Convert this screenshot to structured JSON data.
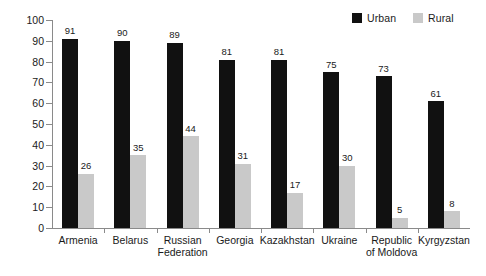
{
  "chart_data": {
    "type": "bar",
    "title": "",
    "subtitle": "",
    "xlabel": "",
    "ylabel": "",
    "ylim": [
      0,
      100
    ],
    "ytick_step": 10,
    "yticks": [
      0,
      10,
      20,
      30,
      40,
      50,
      60,
      70,
      80,
      90,
      100
    ],
    "grid": false,
    "legend_position": "top-right",
    "categories": [
      "Armenia",
      "Belarus",
      "Russian\nFederation",
      "Georgia",
      "Kazakhstan",
      "Ukraine",
      "Republic\nof Moldova",
      "Kyrgyzstan"
    ],
    "series": [
      {
        "name": "Urban",
        "color": "#111111",
        "values": [
          91,
          90,
          89,
          81,
          81,
          75,
          73,
          61
        ]
      },
      {
        "name": "Rural",
        "color": "#c9c9c9",
        "values": [
          26,
          35,
          44,
          31,
          17,
          30,
          5,
          8
        ]
      }
    ]
  },
  "legend": {
    "entries": [
      {
        "label": "Urban",
        "color": "#111111"
      },
      {
        "label": "Rural",
        "color": "#c9c9c9"
      }
    ]
  },
  "axis": {
    "line_color": "#8a8a8a"
  }
}
